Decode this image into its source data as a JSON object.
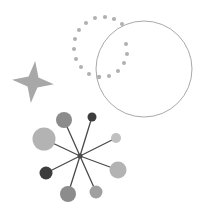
{
  "canvas": {
    "width": 207,
    "height": 215,
    "background_color": "#ffffff",
    "title": "Abstract geometric shapes illustration"
  },
  "palette": {
    "star_fill": "#a8a8a8",
    "dot_fill": "#b0b0b0",
    "circle_stroke": "#a9a9a9",
    "spoke_stroke": "#4a4a4a",
    "hub_fill": "#4a4a4a",
    "node_dark": "#3d3d3d",
    "node_mid_dark": "#6e6e6e",
    "node_mid": "#8c8c8c",
    "node_light": "#b3b3b3",
    "node_lighter": "#c0c0c0"
  },
  "shapes": {
    "four_point_star": {
      "name": "four-point-star",
      "center_x": 33,
      "center_y": 82,
      "outer_radius": 21,
      "inner_radius": 7,
      "rotation_deg": 6,
      "fill": "#a8a8a8",
      "points": 4
    },
    "dotted_arc": {
      "name": "dotted-arc-ring",
      "center_x": 101,
      "center_y": 50,
      "radius": 33,
      "dot_radius": 2.0,
      "fill": "#b0b0b0",
      "start_angle_deg": -50,
      "end_angle_deg": 250,
      "dot_count": 17,
      "dots": [
        {
          "x": 122,
          "y": 24,
          "r": 2.0
        },
        {
          "x": 114,
          "y": 19,
          "r": 2.1
        },
        {
          "x": 105,
          "y": 17,
          "r": 2.1
        },
        {
          "x": 95,
          "y": 18,
          "r": 2.0
        },
        {
          "x": 86,
          "y": 23,
          "r": 2.0
        },
        {
          "x": 79,
          "y": 30,
          "r": 2.0
        },
        {
          "x": 75,
          "y": 39,
          "r": 2.0
        },
        {
          "x": 74,
          "y": 49,
          "r": 2.0
        },
        {
          "x": 76,
          "y": 59,
          "r": 2.0
        },
        {
          "x": 81,
          "y": 67,
          "r": 2.0
        },
        {
          "x": 89,
          "y": 74,
          "r": 2.0
        },
        {
          "x": 99,
          "y": 77,
          "r": 2.2
        },
        {
          "x": 109,
          "y": 76,
          "r": 2.0
        },
        {
          "x": 118,
          "y": 71,
          "r": 2.0
        },
        {
          "x": 124,
          "y": 63,
          "r": 2.0
        },
        {
          "x": 127,
          "y": 54,
          "r": 2.0
        },
        {
          "x": 126,
          "y": 44,
          "r": 2.0
        }
      ]
    },
    "large_circle": {
      "name": "large-circle-outline",
      "center_x": 144,
      "center_y": 69,
      "radius": 48,
      "stroke": "#a9a9a9",
      "stroke_width": 1,
      "fill": "none"
    },
    "node_graph": {
      "name": "hub-and-spoke-node-graph",
      "hub": {
        "label": "hub",
        "x": 80,
        "y": 156,
        "r": 2.5,
        "fill": "#4a4a4a"
      },
      "spoke_stroke": "#4a4a4a",
      "spoke_width": 1.3,
      "node_count": 8,
      "nodes": [
        {
          "label": "node-1",
          "x": 44,
          "y": 139,
          "r": 11.5,
          "fill": "#b3b3b3"
        },
        {
          "label": "node-2",
          "x": 64,
          "y": 120,
          "r": 8.0,
          "fill": "#8c8c8c"
        },
        {
          "label": "node-3",
          "x": 92,
          "y": 117,
          "r": 4.5,
          "fill": "#3d3d3d"
        },
        {
          "label": "node-4",
          "x": 116,
          "y": 138,
          "r": 5.0,
          "fill": "#c0c0c0"
        },
        {
          "label": "node-5",
          "x": 118,
          "y": 170,
          "r": 8.5,
          "fill": "#b3b3b3"
        },
        {
          "label": "node-6",
          "x": 96,
          "y": 192,
          "r": 6.5,
          "fill": "#a0a0a0"
        },
        {
          "label": "node-7",
          "x": 68,
          "y": 194,
          "r": 8.0,
          "fill": "#8c8c8c"
        },
        {
          "label": "node-8",
          "x": 46,
          "y": 173,
          "r": 6.5,
          "fill": "#3d3d3d"
        }
      ]
    }
  }
}
